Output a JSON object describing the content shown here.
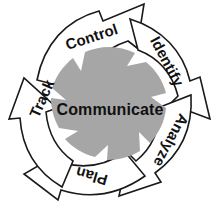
{
  "diagram": {
    "type": "cyclic-process",
    "title": "Communicate",
    "direction": "clockwise",
    "center": {
      "label": "Communicate",
      "fill_color": "#a6a6a6",
      "text_color": "#111111"
    },
    "colors": {
      "background": "#ffffff",
      "arrow_fill": "#ffffff",
      "arrow_outline": "#1a1a1a",
      "center_fill": "#a6a6a6",
      "label_text": "#111111"
    },
    "stages": [
      {
        "id": "control",
        "label": "Control",
        "position": "top",
        "order": 1,
        "label_rotation_deg": -18,
        "label_x": 92,
        "label_y": 38
      },
      {
        "id": "identify",
        "label": "Identify",
        "position": "upper-right",
        "order": 2,
        "label_rotation_deg": 62,
        "label_x": 166,
        "label_y": 62
      },
      {
        "id": "analyze",
        "label": "Analyze",
        "position": "lower-right",
        "order": 3,
        "label_rotation_deg": 118,
        "label_x": 170,
        "label_y": 140
      },
      {
        "id": "plan",
        "label": "Plan",
        "position": "bottom",
        "order": 4,
        "label_rotation_deg": 196,
        "label_x": 92,
        "label_y": 175
      },
      {
        "id": "track",
        "label": "Track",
        "position": "left",
        "order": 5,
        "label_rotation_deg": -66,
        "label_x": 43,
        "label_y": 99
      }
    ]
  }
}
